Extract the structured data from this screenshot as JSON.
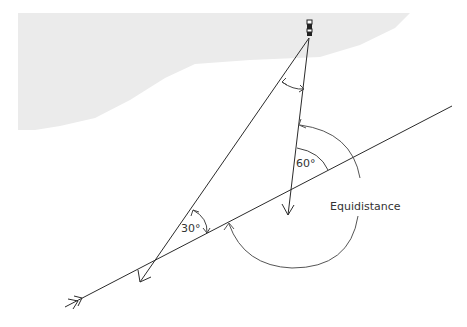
{
  "diagram": {
    "labels": {
      "angle_30": "30°",
      "angle_60": "60°",
      "equidistance": "Equidistance"
    },
    "colors": {
      "land": "#ebebeb",
      "line": "#2b2b2b",
      "arc": "#555555",
      "background": "#ffffff"
    },
    "elements": [
      "land-mass",
      "lighthouse",
      "first-bearing-line",
      "second-bearing-line",
      "course-line",
      "angle-arc-30",
      "angle-arc-60",
      "angle-between-bearings",
      "equidistance-arc"
    ]
  }
}
